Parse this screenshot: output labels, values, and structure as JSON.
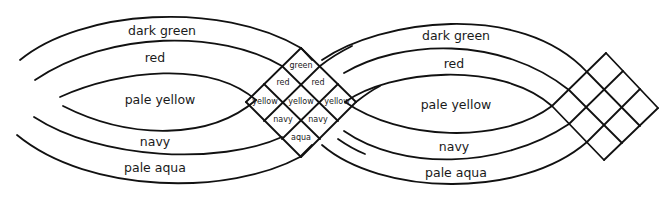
{
  "diagram": {
    "title": "",
    "left_bands": {
      "dark_green": "dark green",
      "red": "red",
      "pale_yellow": "pale yellow",
      "navy": "navy",
      "pale_aqua": "pale aqua"
    },
    "right_bands": {
      "dark_green": "dark green",
      "red": "red",
      "pale_yellow": "pale yellow",
      "navy": "navy",
      "pale_aqua": "pale aqua"
    },
    "center_cells": {
      "top": "green",
      "upper_left": "red",
      "upper_right": "red",
      "middle_left": "yellow",
      "middle_center": "yellow",
      "middle_right": "yellow",
      "lower_left": "navy",
      "lower_right": "navy",
      "bottom": "aqua"
    },
    "right_lattice": {
      "grid": "3x3",
      "labels": []
    },
    "stroke_color": "#111111",
    "background_color": "#ffffff"
  }
}
